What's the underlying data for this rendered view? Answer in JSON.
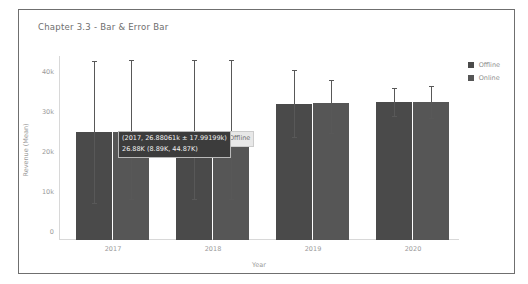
{
  "chart_data": {
    "type": "bar",
    "title": "Chapter 3.3 - Bar & Error Bar",
    "xlabel": "Year",
    "ylabel": "Revenue (Mean)",
    "ylim": [
      0,
      45000
    ],
    "yticks": [
      0,
      10000,
      20000,
      30000,
      40000
    ],
    "ytick_labels": [
      "0",
      "10k",
      "20k",
      "30k",
      "40k"
    ],
    "grid": false,
    "legend_position": "right",
    "categories": [
      "2017",
      "2018",
      "2019",
      "2020"
    ],
    "series": [
      {
        "name": "Offline",
        "color": "#4a4a4a",
        "values": [
          26881,
          24300,
          33900,
          34400
        ],
        "error_low": [
          8890,
          9900,
          25600,
          30700
        ],
        "error_high": [
          44870,
          45100,
          42600,
          38000
        ]
      },
      {
        "name": "Online",
        "color": "#565656",
        "values": [
          26881,
          24300,
          34200,
          34500
        ],
        "error_low": [
          10100,
          9900,
          26400,
          30300
        ],
        "error_high": [
          45000,
          44900,
          40100,
          38600
        ]
      }
    ]
  },
  "tooltip": {
    "line1": "(2017, 26.88061k ± 17.99199k)",
    "line2": "26.88K (8.89K, 44.87K)",
    "series_tag": "Offline"
  },
  "legend": {
    "items": [
      {
        "label": "Offline",
        "color": "#4a4a4a"
      },
      {
        "label": "Online",
        "color": "#565656"
      }
    ]
  },
  "colors": {
    "frame": "#6f6f6f",
    "axis": "#d8d8d8",
    "text_muted": "#9a9a9a",
    "tooltip_bg": "#3c3c3c"
  }
}
